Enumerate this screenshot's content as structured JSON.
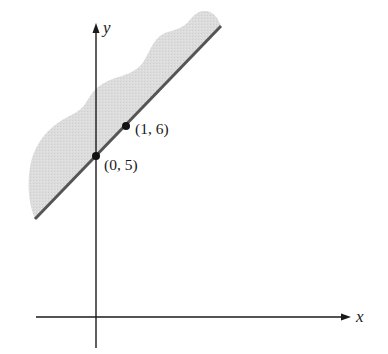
{
  "diagram": {
    "type": "linear-inequality-graph",
    "axes": {
      "x_label": "x",
      "y_label": "y"
    },
    "boundary_line": {
      "style": "solid",
      "points": [
        {
          "x": 0,
          "y": 5,
          "label": "(0, 5)"
        },
        {
          "x": 1,
          "y": 6,
          "label": "(1, 6)"
        }
      ]
    },
    "shaded_region": "above the line",
    "colors": {
      "shade": "#d9d9d9",
      "line": "#555555",
      "axis": "#1a1a1a",
      "point": "#111111"
    }
  }
}
